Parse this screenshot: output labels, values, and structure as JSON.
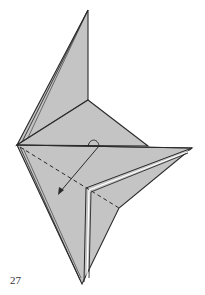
{
  "diagram": {
    "step_number": "27",
    "paper_color": "#c4c4c4",
    "line_color": "#2a2a2a",
    "instructions": {
      "fold_line": "valley fold (dashed) from left tip to right notch",
      "arrow": "fold flap down and to the left"
    }
  }
}
